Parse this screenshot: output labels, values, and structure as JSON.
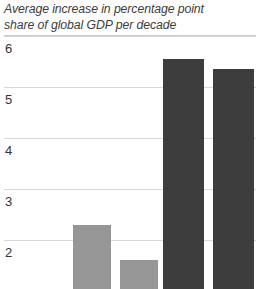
{
  "chart_data": {
    "type": "bar",
    "title": "Average increase in percentage point share of global GDP per decade",
    "title_lines": [
      "Average increase in percentage point",
      "share of global GDP per decade"
    ],
    "xlabel": "",
    "ylabel": "",
    "ylim": [
      1.35,
      6.0
    ],
    "yticks": [
      6,
      5,
      4,
      3,
      2
    ],
    "ytick_labels": [
      "6",
      "5",
      "4",
      "3",
      "2"
    ],
    "grid": true,
    "legend": "none",
    "categories": [
      "bar-1",
      "bar-2",
      "bar-3",
      "bar-4"
    ],
    "values": [
      2.3,
      1.6,
      5.55,
      5.35
    ],
    "colors": [
      "#969696",
      "#969696",
      "#3d3d3d",
      "#3d3d3d"
    ],
    "series": [
      {
        "name": "Average increase in percentage point share of global GDP per decade",
        "values": [
          2.3,
          1.6,
          5.55,
          5.35
        ]
      }
    ]
  },
  "axis": {
    "tick_6": "6",
    "tick_5": "5",
    "tick_4": "4",
    "tick_3": "3",
    "tick_2": "2"
  },
  "style": {
    "bar_light": "#969696",
    "bar_dark": "#3d3d3d",
    "gridline_color": "#d8d8d8",
    "rule_color": "#c9c9c9",
    "text_color": "#333333",
    "background": "#ffffff"
  }
}
